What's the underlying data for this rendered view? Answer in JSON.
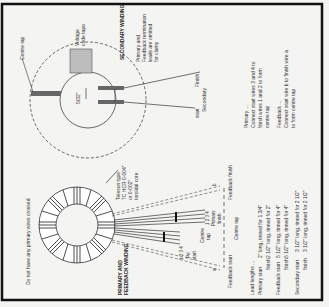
{
  "orientation": "rotated 90° counter-clockwise (text reads bottom-to-top)",
  "secondary": {
    "title": "SECONDARY WINDING",
    "centre_tap_label": "Centre tap",
    "voltage_tape_label_1": "Voltage",
    "voltage_tape_label_2": "code tape",
    "gap_label": "5/32\"",
    "note_1": "Primary and",
    "note_2": "Feedback termination",
    "note_3": "leads are omitted",
    "note_4": "for clarity",
    "start_label": "start",
    "finish_label": "Finish",
    "secondary_label": "Secondary"
  },
  "connections": {
    "primary_heading": "Primary ...",
    "primary_line_1": "Connect start wires 3 and 4 to",
    "primary_line_2": "finish wires 1 and 2 to form",
    "primary_line_3": "centre tap",
    "feedback_heading": "Feedback ...",
    "feedback_line_1": "Connect start wire b to finish wire a",
    "feedback_line_2": "to form centre tap"
  },
  "primary": {
    "title_1": "PRIMARY AND",
    "title_2": "FEEDBACK WINDING",
    "warning": "Do not have any primary wires crossed",
    "tape_1": "Teleson type",
    "tape_2": "7C HCR 0-004\"",
    "tape_3": "or 0-002\"",
    "tape_4": "toroidal core",
    "pri_start_1": "Pri",
    "pri_start_2": "start",
    "nums_a": "1 2 3 4",
    "nums_b": "1 2 3 4",
    "centre_tap_1": "Centre",
    "centre_tap_2": "tap",
    "primary_finish_1": "Primary",
    "primary_finish_2": "finish",
    "feedback_start": "Feedback start",
    "centre_tap_bottom": "Centre tap",
    "feedback_finish": "Feedback finish",
    "lead_a": "a",
    "lead_b": "b"
  },
  "lead_lengths": {
    "heading": "Lead lengths ...",
    "rows": [
      {
        "label": "Primary start",
        "value": "2\" long, tinned for 1 3/4\""
      },
      {
        "label": "finish",
        "value": "2 1/2\" long, tinned for 2\""
      },
      {
        "label": "Feedback start",
        "value": "5 1/2\" long, tinned for 4\""
      },
      {
        "label": "finish",
        "value": "5 1/2\" long, tinned for 4\""
      },
      {
        "label": "Secondary start",
        "value": "3 1/2\" long, tinned for 2 1/2\""
      },
      {
        "label": "finish",
        "value": "3 1/2\" long, tinned for 2 1/2\""
      }
    ]
  },
  "colors": {
    "line": "#333333",
    "tape": "#b9b9b9",
    "border": "#111111"
  }
}
